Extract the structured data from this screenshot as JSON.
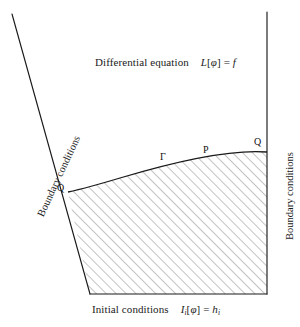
{
  "figure": {
    "title_region": {
      "text": "Differential equation",
      "equation_operator": "L",
      "equation_bracket_open": "[",
      "equation_field": "φ",
      "equation_bracket_close": "]",
      "equation_equals": "=",
      "equation_rhs": "f"
    },
    "bottom_region": {
      "text": "Initial conditions",
      "equation_operator": "I",
      "equation_operator_sub": "i",
      "equation_bracket_open": "[",
      "equation_field": "φ",
      "equation_bracket_close": "]",
      "equation_equals": "=",
      "equation_rhs": "h",
      "equation_rhs_sub": "i"
    },
    "left_boundary_label": "Boundary conditions",
    "right_boundary_label": "Boundary conditions",
    "points": {
      "gamma": "Γ",
      "p": "P",
      "q_left": "Q",
      "q_right": "Q"
    },
    "colors": {
      "ink": "#1a1a1a",
      "hatch": "#7a7a7a",
      "background": "#ffffff"
    },
    "geometry": {
      "left_line_start": [
        12,
        14
      ],
      "left_line_corner_q": [
        68,
        192
      ],
      "bottom_left_corner": [
        90,
        294
      ],
      "bottom_right_corner": [
        267,
        294
      ],
      "right_line_start": [
        267,
        12
      ],
      "right_corner_q": [
        267,
        152
      ],
      "curve_type": "concave-up boundary from Q-left to Q-right",
      "hatch_angle_deg": 45,
      "hatch_spacing_px": 7
    }
  }
}
